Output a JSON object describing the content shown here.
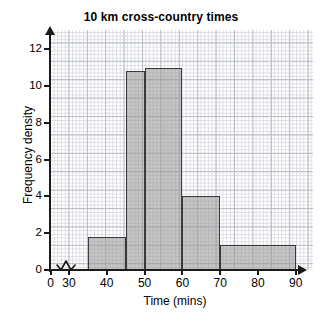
{
  "chart_data": {
    "type": "bar",
    "title": "10 km cross-country times",
    "xlabel": "Time (mins)",
    "ylabel": "Frequency density",
    "grid": true,
    "legend": null,
    "xlim": [
      30,
      90
    ],
    "ylim": [
      0,
      12.4
    ],
    "x_ticks": [
      "0",
      "30",
      "40",
      "50",
      "60",
      "70",
      "80",
      "90"
    ],
    "y_ticks": [
      "0",
      "2",
      "4",
      "6",
      "8",
      "10",
      "12"
    ],
    "axis_break": "zigzag between 0 and 30 on time axis",
    "bin_edges": [
      35,
      45,
      50,
      60,
      70,
      90
    ],
    "categories": [
      "35-45",
      "45-50",
      "50-60",
      "60-70",
      "70-90"
    ],
    "values": [
      1.8,
      10.8,
      11.0,
      4.0,
      1.35
    ],
    "bars": [
      {
        "label": "35-45",
        "start": 35,
        "end": 45,
        "density": 1.8
      },
      {
        "label": "45-50",
        "start": 45,
        "end": 50,
        "density": 10.8
      },
      {
        "label": "50-60",
        "start": 50,
        "end": 60,
        "density": 11.0
      },
      {
        "label": "60-70",
        "start": 60,
        "end": 70,
        "density": 4.0
      },
      {
        "label": "70-90",
        "start": 70,
        "end": 90,
        "density": 1.35
      }
    ],
    "colors": {
      "bar_fill": "#a8a8a8",
      "bar_edge": "#3a3a3a",
      "axis": "#1a1a1a",
      "grid_minor": "#dcdee3",
      "grid_major": "#b9bcc4",
      "background": "#ffffff",
      "text": "#000000"
    }
  }
}
